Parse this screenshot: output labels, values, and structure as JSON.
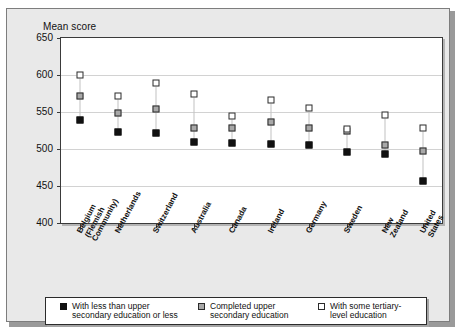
{
  "chart_data": {
    "type": "scatter",
    "title": "",
    "ylabel": "Mean score",
    "xlabel": "",
    "ylim": [
      400,
      650
    ],
    "yticks": [
      400,
      450,
      500,
      550,
      600,
      650
    ],
    "grid": true,
    "legend_position": "bottom",
    "categories": [
      "Belgium\n(Flemish\nCommunity)",
      "Netherlands",
      "Switzerland",
      "Australia",
      "Canada",
      "Ireland",
      "Germany",
      "Sweden",
      "New\nZealand",
      "United\nStates"
    ],
    "series": [
      {
        "name": "With less than upper\nsecondary education or less",
        "marker": "filled-black-square",
        "color": "#111111",
        "values": [
          539,
          523,
          521,
          509,
          508,
          507,
          505,
          496,
          493,
          457
        ]
      },
      {
        "name": "Completed upper\nsecondary education",
        "marker": "filled-gray-square",
        "color": "#a8a8a8",
        "values": [
          572,
          549,
          554,
          528,
          528,
          537,
          528,
          524,
          505,
          497
        ]
      },
      {
        "name": "With some tertiary-\nlevel education",
        "marker": "open-square",
        "color": "#ffffff",
        "values": [
          600,
          572,
          589,
          574,
          545,
          566,
          555,
          527,
          546,
          528
        ]
      }
    ]
  },
  "legend": {
    "items": [
      {
        "swatch": "filled-black-square",
        "line1": "With less than upper",
        "line2": "secondary education or less"
      },
      {
        "swatch": "filled-gray-square",
        "line1": "Completed upper",
        "line2": "secondary education"
      },
      {
        "swatch": "open-square",
        "line1": "With some tertiary-",
        "line2": "level education"
      }
    ]
  }
}
